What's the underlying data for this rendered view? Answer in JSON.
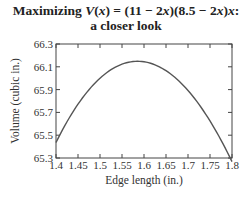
{
  "title_line1": "Maximizing V(x) = (11 − 2x)(8.5 − 2x)x:",
  "title_line2": "a closer look",
  "chart_data": {
    "type": "line",
    "title": "Maximizing V(x) = (11 − 2x)(8.5 − 2x)x: a closer look",
    "xlabel": "Edge length (in.)",
    "ylabel": "Volume (cubic in.)",
    "xlim": [
      1.4,
      1.8
    ],
    "ylim": [
      65.3,
      66.3
    ],
    "x_ticks": [
      "1.4",
      "1.45",
      "1.5",
      "1.55",
      "1.6",
      "1.65",
      "1.7",
      "1.75",
      "1.8"
    ],
    "y_ticks": [
      "65.3",
      "65.5",
      "65.7",
      "65.9",
      "66.1",
      "66.3"
    ],
    "grid": false,
    "legend": null,
    "series": [
      {
        "name": "V(x)",
        "x": [
          1.4,
          1.45,
          1.5,
          1.55,
          1.585,
          1.6,
          1.65,
          1.7,
          1.75,
          1.8
        ],
        "values": [
          65.44,
          65.76,
          65.98,
          66.12,
          66.15,
          66.14,
          66.06,
          65.86,
          65.61,
          65.27
        ]
      }
    ]
  }
}
